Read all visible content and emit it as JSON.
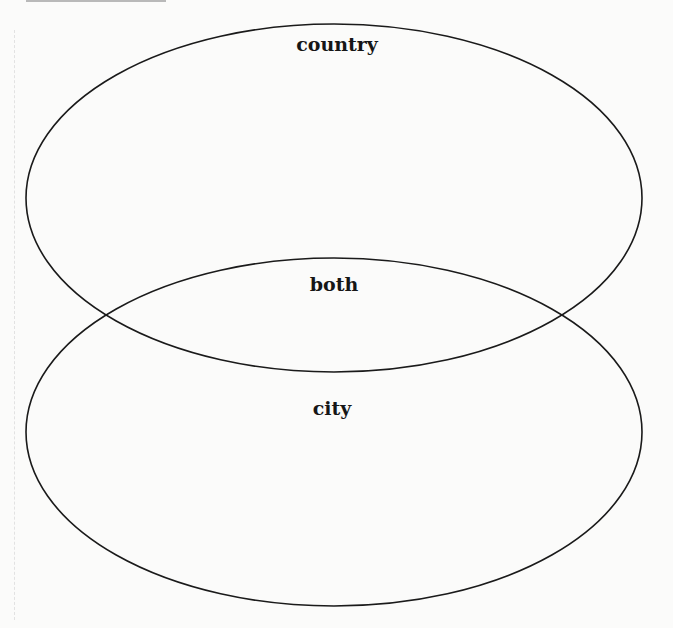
{
  "diagram": {
    "type": "venn",
    "sets": [
      {
        "name": "country",
        "position": "top"
      },
      {
        "name": "city",
        "position": "bottom"
      }
    ],
    "labels": {
      "top": "country",
      "intersection": "both",
      "bottom": "city"
    },
    "stroke_color": "#1a1a1a",
    "background_color": "#fbfbfa"
  }
}
